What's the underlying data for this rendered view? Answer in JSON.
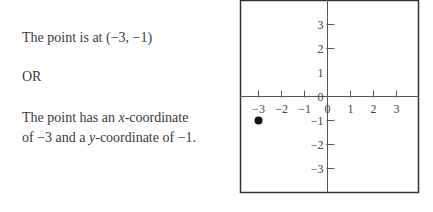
{
  "text": {
    "line1": "The point is at (−3, −1)",
    "or": "OR",
    "line3a_pre": "The point has an ",
    "line3a_var": "x",
    "line3a_post": "-coordinate",
    "line3b_pre": "of −3 and a ",
    "line3b_var": "y",
    "line3b_post": "-coordinate of −1."
  },
  "chart_data": {
    "type": "scatter",
    "title": "",
    "xlabel": "",
    "ylabel": "",
    "x_ticks": [
      "−3",
      "−2",
      "−1",
      "0",
      "1",
      "2",
      "3"
    ],
    "y_ticks": [
      "3",
      "2",
      "1",
      "0",
      "−1",
      "−2",
      "−3"
    ],
    "xlim": [
      -3.7,
      4
    ],
    "ylim": [
      -4,
      4
    ],
    "grid": false,
    "points": [
      {
        "x": -3,
        "y": -1
      }
    ],
    "colors": {
      "axis": "#555555",
      "frame": "#333333",
      "point": "#111111"
    }
  }
}
